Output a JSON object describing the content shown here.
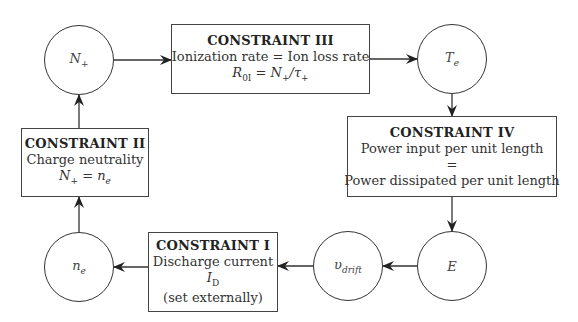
{
  "diagram": {
    "type": "cycle-flowchart",
    "nodes": {
      "n_plus": {
        "label": "N",
        "sub": "+"
      },
      "t_e": {
        "label": "T",
        "sub": "e"
      },
      "e_field": {
        "label": "E"
      },
      "v_drift": {
        "label": "υ",
        "sub": "drift"
      },
      "n_e": {
        "label": "n",
        "sub": "e"
      }
    },
    "constraints": {
      "c3": {
        "title": "CONSTRAINT III",
        "line1": "Ionization rate = Ion loss rate",
        "eq_lhs": "R",
        "eq_lhs_sub": "0I",
        "eq_rhs": " = N",
        "eq_rhs_sub": "+",
        "eq_tail": "/τ",
        "eq_tail_sub": "+"
      },
      "c4": {
        "title": "CONSTRAINT IV",
        "line1": "Power input per unit length",
        "line2": "=",
        "line3": "Power dissipated per unit length"
      },
      "c1": {
        "title": "CONSTRAINT I",
        "line1": "Discharge current",
        "eq": "I",
        "eq_sub": "D",
        "line3": "(set externally)"
      },
      "c2": {
        "title": "CONSTRAINT II",
        "line1": "Charge neutrality",
        "eq_a": "N",
        "eq_a_sub": "+",
        "eq_mid": " = n",
        "eq_b_sub": "e"
      }
    },
    "edges": [
      {
        "from": "N+",
        "to": "CONSTRAINT III"
      },
      {
        "from": "CONSTRAINT III",
        "to": "Te"
      },
      {
        "from": "Te",
        "to": "CONSTRAINT IV"
      },
      {
        "from": "CONSTRAINT IV",
        "to": "E"
      },
      {
        "from": "E",
        "to": "v_drift"
      },
      {
        "from": "v_drift",
        "to": "CONSTRAINT I"
      },
      {
        "from": "CONSTRAINT I",
        "to": "ne"
      },
      {
        "from": "ne",
        "to": "CONSTRAINT II"
      },
      {
        "from": "CONSTRAINT II",
        "to": "N+"
      }
    ]
  }
}
